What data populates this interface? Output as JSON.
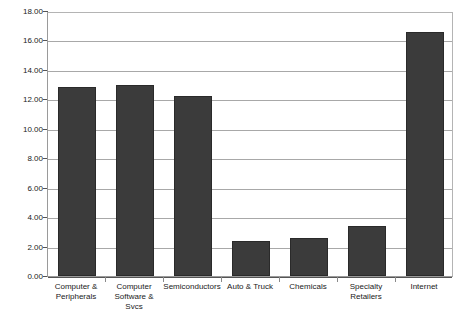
{
  "chart_data": {
    "type": "bar",
    "title": "",
    "xlabel": "",
    "ylabel": "",
    "categories": [
      "Computer &\nPeripherals",
      "Computer\nSoftware & Svcs",
      "Semiconductors",
      "Auto & Truck",
      "Chemicals",
      "Specialty\nRetailers",
      "Internet"
    ],
    "values": [
      12.85,
      12.95,
      12.25,
      2.4,
      2.6,
      3.4,
      16.6
    ],
    "ylim": [
      0.0,
      18.0
    ],
    "ytick_values": [
      0.0,
      2.0,
      4.0,
      6.0,
      8.0,
      10.0,
      12.0,
      14.0,
      16.0,
      18.0
    ],
    "ytick_labels": [
      "0.00",
      "2.00",
      "4.00",
      "6.00",
      "8.00",
      "10.00",
      "12.00",
      "14.00",
      "16.00",
      "18.00"
    ],
    "grid": true,
    "legend": false,
    "series_color": "#3b3b3b",
    "gridline_color": "#a8a8a8",
    "axis_color": "#555555",
    "background_color": "#ffffff"
  }
}
